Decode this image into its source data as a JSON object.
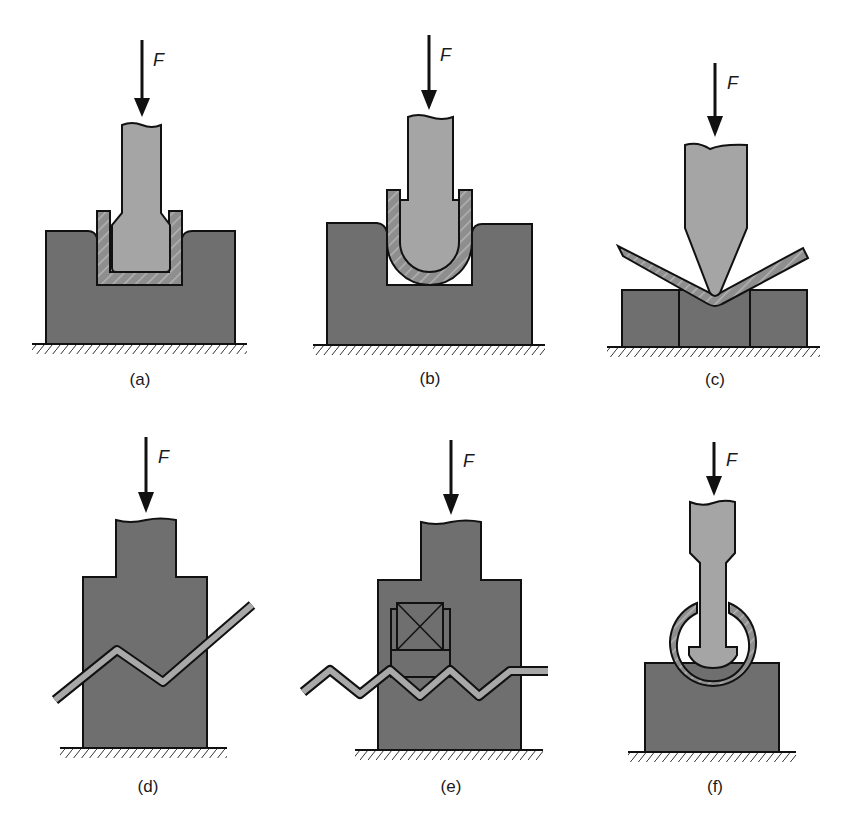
{
  "figure": {
    "force_label": "F",
    "colors": {
      "die": "#6f6f6f",
      "punch": "#a5a5a5",
      "sheet": "#8a8a8a",
      "sheet_light": "#b9b9b9",
      "outline": "#111111",
      "background": "#ffffff"
    },
    "panels": [
      {
        "id": "a",
        "label": "(a)",
        "operation": "channel forming, square punch"
      },
      {
        "id": "b",
        "label": "(b)",
        "operation": "U-die bending, rounded punch"
      },
      {
        "id": "c",
        "label": "(c)",
        "operation": "V-die bending"
      },
      {
        "id": "d",
        "label": "(d)",
        "operation": "offset / joggle forming"
      },
      {
        "id": "e",
        "label": "(e)",
        "operation": "corrugating with pressure pad"
      },
      {
        "id": "f",
        "label": "(f)",
        "operation": "tube forming / curling"
      }
    ]
  }
}
